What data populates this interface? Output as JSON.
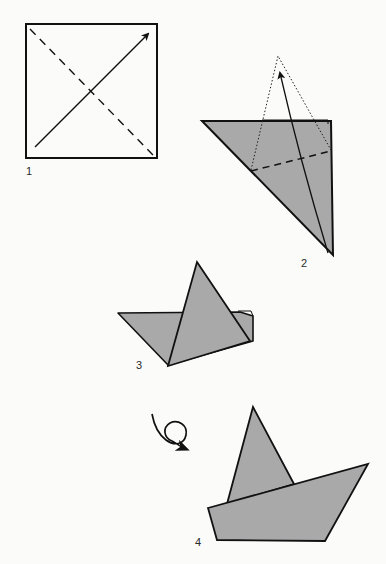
{
  "diagram": {
    "paper_color": "#a9a9a9",
    "line_color": "#111111",
    "background": "#fbfbfa",
    "steps": [
      {
        "number": "1",
        "description": "Square with dashed diagonal fold line and arrow folding bottom-left corner to top-right corner"
      },
      {
        "number": "2",
        "description": "Folded triangle with dashed horizontal fold line; dotted outline and arrow show bottom tip folding up"
      },
      {
        "number": "3",
        "description": "Triangle with upward-pointing flap forming the sail"
      },
      {
        "number": "4",
        "description": "Finished boat after turning over, with sail and hull"
      }
    ],
    "symbols": {
      "turn_over": "loop-arrow-icon"
    }
  }
}
